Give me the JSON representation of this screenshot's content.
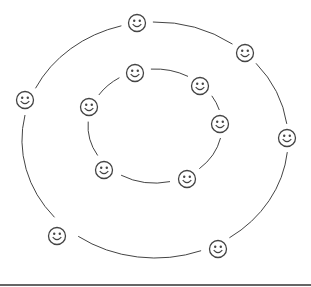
{
  "diagram": {
    "type": "concentric-rings-of-smiley-faces",
    "colors": {
      "stroke": "#444444",
      "background": "#ffffff",
      "bottom_rule": "#555555"
    },
    "outer_ring": {
      "center": [
        155,
        140
      ],
      "rx": 133,
      "ry": 118,
      "faces": [
        {
          "id": "outer-1",
          "x": 137,
          "y": 23
        },
        {
          "id": "outer-2",
          "x": 245,
          "y": 53
        },
        {
          "id": "outer-3",
          "x": 287,
          "y": 138
        },
        {
          "id": "outer-4",
          "x": 218,
          "y": 249
        },
        {
          "id": "outer-5",
          "x": 57,
          "y": 236
        },
        {
          "id": "outer-6",
          "x": 25,
          "y": 100
        }
      ]
    },
    "inner_ring": {
      "center": [
        155,
        126
      ],
      "rx": 67,
      "ry": 57,
      "faces": [
        {
          "id": "inner-1",
          "x": 135,
          "y": 73
        },
        {
          "id": "inner-2",
          "x": 200,
          "y": 86
        },
        {
          "id": "inner-3",
          "x": 220,
          "y": 124
        },
        {
          "id": "inner-4",
          "x": 187,
          "y": 179
        },
        {
          "id": "inner-5",
          "x": 104,
          "y": 170
        },
        {
          "id": "inner-6",
          "x": 89,
          "y": 107
        }
      ]
    },
    "face_radius": 8.5
  }
}
